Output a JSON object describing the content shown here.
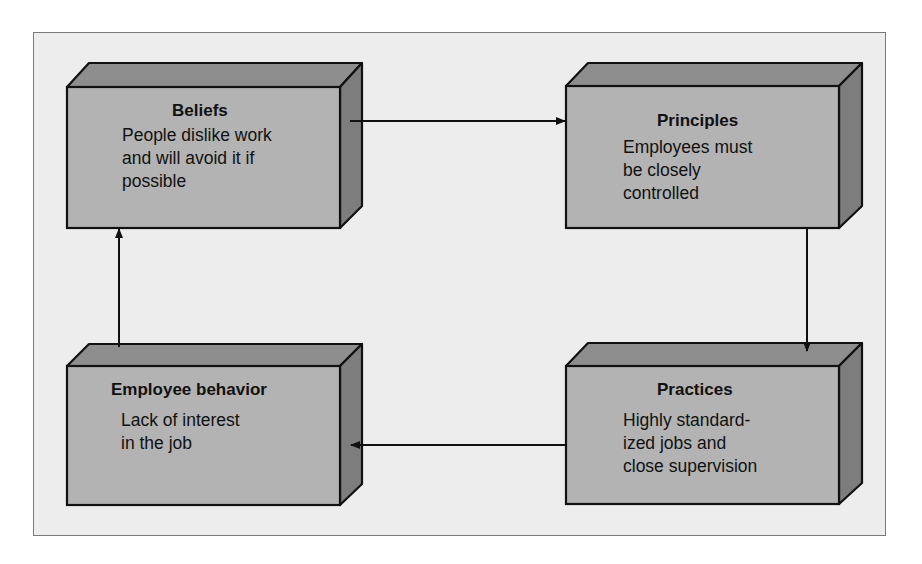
{
  "diagram": {
    "type": "cycle-flow",
    "colors": {
      "front_face": "#b3b3b3",
      "top_face": "#8e8e8e",
      "side_face": "#7d7d7d",
      "background": "#ededed",
      "stroke": "#111111"
    },
    "boxes": [
      {
        "id": "beliefs",
        "title": "Beliefs",
        "body": "People dislike work\nand will avoid it if\npossible"
      },
      {
        "id": "principles",
        "title": "Principles",
        "body": "Employees must\nbe closely\ncontrolled"
      },
      {
        "id": "practices",
        "title": "Practices",
        "body": "Highly standard-\nized jobs and\nclose supervision"
      },
      {
        "id": "employee_behavior",
        "title": "Employee behavior",
        "body": "Lack of interest\nin the job"
      }
    ],
    "edges": [
      {
        "from": "beliefs",
        "to": "principles"
      },
      {
        "from": "principles",
        "to": "practices"
      },
      {
        "from": "practices",
        "to": "employee_behavior"
      },
      {
        "from": "employee_behavior",
        "to": "beliefs"
      }
    ]
  }
}
